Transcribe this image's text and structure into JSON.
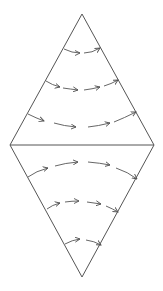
{
  "diagram": {
    "shape": "rhombus",
    "vertices": {
      "top": [
        82,
        14
      ],
      "right": [
        154,
        145
      ],
      "bottom": [
        82,
        277
      ],
      "left": [
        10,
        145
      ]
    },
    "divider": "horizontal line through middle",
    "stroke_color": "#555555",
    "background": "#ffffff",
    "flow_direction": "left-to-right",
    "upper_half": {
      "rows": [
        {
          "y": 52,
          "arrows": 2,
          "curve": "sagging"
        },
        {
          "y": 85,
          "arrows": 4,
          "curve": "sagging"
        },
        {
          "y": 122,
          "arrows": 4,
          "curve": "sagging"
        }
      ]
    },
    "lower_half": {
      "rows": [
        {
          "y": 168,
          "arrows": 4,
          "curve": "arched"
        },
        {
          "y": 206,
          "arrows": 4,
          "curve": "arched"
        },
        {
          "y": 243,
          "arrows": 2,
          "curve": "arched"
        }
      ]
    }
  }
}
